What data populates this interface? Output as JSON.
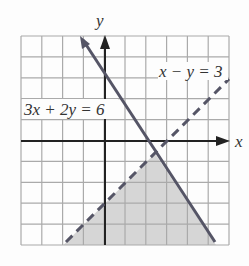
{
  "graph": {
    "x_axis_label": "x",
    "y_axis_label": "y",
    "x_range": [
      -4,
      6
    ],
    "y_range": [
      -5,
      5
    ],
    "grid_step": 1,
    "lines": [
      {
        "equation": "3x + 2y = 6",
        "style": "solid",
        "color": "#555566"
      },
      {
        "equation": "x − y = 3",
        "style": "dashed",
        "color": "#555566"
      }
    ],
    "shaded_region": {
      "vertices": [
        [
          -2,
          -5
        ],
        [
          2.4,
          -0.6
        ],
        [
          5.333,
          -5
        ]
      ],
      "color": "#d6d6d6"
    },
    "colors": {
      "grid": "#aaaaaa",
      "axes": "#222222",
      "background": "#fdfdfd"
    }
  },
  "labels": {
    "solid_line": "3x + 2y = 6",
    "dashed_line": "x − y = 3"
  }
}
